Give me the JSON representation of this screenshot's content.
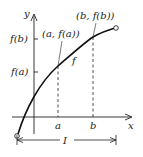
{
  "diagram": {
    "axes": {
      "x_label": "x",
      "y_label": "y"
    },
    "y_ticks": [
      {
        "label": "f(b)"
      },
      {
        "label": "f(a)"
      }
    ],
    "x_ticks": [
      {
        "label": "a"
      },
      {
        "label": "b"
      }
    ],
    "points": [
      {
        "label": "(a, f(a))"
      },
      {
        "label": "(b, f(b))"
      }
    ],
    "curve_label": "f",
    "interval_label": "I",
    "colors": {
      "ink": "#222222",
      "background": "#ffffff"
    }
  }
}
